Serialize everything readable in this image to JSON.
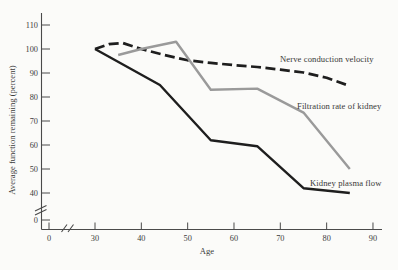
{
  "figure": {
    "background": "#fbfbf9"
  },
  "chart_data": {
    "type": "line",
    "title": "",
    "xlabel": "Age",
    "ylabel": "Average function remaining (percent)",
    "x_ticks": [
      0,
      30,
      40,
      50,
      60,
      70,
      80,
      90
    ],
    "y_ticks": [
      0,
      40,
      50,
      60,
      70,
      80,
      90,
      100,
      110
    ],
    "x_axis_break_between": [
      0,
      30
    ],
    "y_axis_break_between": [
      0,
      40
    ],
    "x_range_shown": [
      30,
      90
    ],
    "y_range_shown": [
      40,
      110
    ],
    "grid": false,
    "legend": "inline-annotations",
    "axis_color": "#4a4a4a",
    "text_color": "#3b3b3b",
    "series": [
      {
        "name": "Nerve conduction velocity",
        "style": "dashed",
        "color": "#1e1e1e",
        "points": [
          [
            30,
            100
          ],
          [
            33,
            102
          ],
          [
            36,
            102.5
          ],
          [
            40,
            100
          ],
          [
            45,
            97.5
          ],
          [
            50,
            95.3
          ],
          [
            55,
            94.2
          ],
          [
            60,
            93.3
          ],
          [
            65,
            92.5
          ],
          [
            70,
            91.4
          ],
          [
            75,
            90.2
          ],
          [
            80,
            88
          ],
          [
            85,
            84.6
          ]
        ]
      },
      {
        "name": "Filtration rate of kidney",
        "style": "solid",
        "color": "#9a9a9a",
        "points": [
          [
            35,
            97.5
          ],
          [
            40,
            100
          ],
          [
            47.5,
            103
          ],
          [
            55,
            83
          ],
          [
            65,
            83.5
          ],
          [
            75,
            73.5
          ],
          [
            85,
            50
          ]
        ]
      },
      {
        "name": "Kidney plasma flow",
        "style": "solid",
        "color": "#1e1e1e",
        "points": [
          [
            30,
            100
          ],
          [
            44,
            85
          ],
          [
            55,
            62
          ],
          [
            65,
            59.5
          ],
          [
            75,
            42
          ],
          [
            85,
            40
          ]
        ]
      }
    ]
  }
}
